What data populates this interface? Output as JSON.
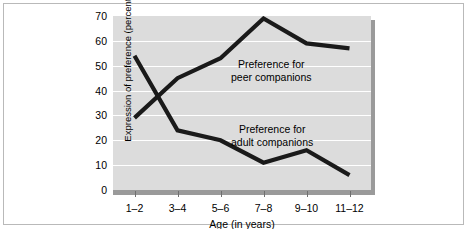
{
  "chart_data": {
    "type": "line",
    "title": "",
    "xlabel": "Age (in years)",
    "ylabel": "Expression of preference (percent)",
    "categories": [
      "1–2",
      "3–4",
      "5–6",
      "7–8",
      "9–10",
      "11–12"
    ],
    "ylim": [
      0,
      70
    ],
    "yticks": [
      0,
      10,
      20,
      30,
      40,
      50,
      60,
      70
    ],
    "grid": "horizontal",
    "legend": "inline-annotations",
    "series": [
      {
        "name": "Preference for peer companions",
        "values": [
          29,
          45,
          53,
          69,
          59,
          57
        ],
        "color": "#1a1a1a",
        "annotation_line1": "Preference for",
        "annotation_line2": "peer companions"
      },
      {
        "name": "Preference for adult companions",
        "values": [
          54,
          24,
          20,
          11,
          16,
          6
        ],
        "color": "#1a1a1a",
        "annotation_line1": "Preference for",
        "annotation_line2": "adult companions"
      }
    ]
  },
  "colors": {
    "plot_background": "#dcdcdc",
    "gridline": "#ffffff",
    "axis_bar": "#9a9a9a",
    "line": "#1a1a1a",
    "frame_border": "#b9b9b9",
    "page_background": "#ffffff"
  }
}
